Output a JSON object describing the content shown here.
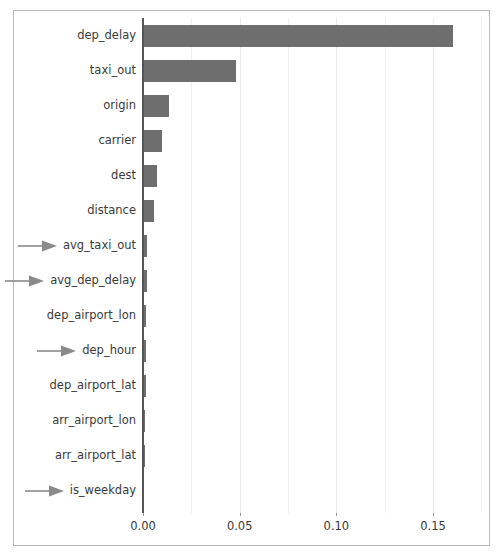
{
  "chart_data": {
    "type": "bar",
    "orientation": "horizontal",
    "title": "",
    "xlabel": "",
    "ylabel": "",
    "xlim": [
      0.0,
      0.1757
    ],
    "xticks": [
      0.0,
      0.05,
      0.1,
      0.15
    ],
    "xtick_labels": [
      "0.00",
      "0.05",
      "0.10",
      "0.15"
    ],
    "grid": true,
    "grid_axis": "x",
    "legend": "none",
    "bar_color": "#6e6e6e",
    "gridline_color": "#ebebeb",
    "axis_color": "#555555",
    "frame_color": "#b9b9b9",
    "annotation_color": "#8a8a8a",
    "annotation_symbol": "right-arrow",
    "categories": [
      "dep_delay",
      "taxi_out",
      "origin",
      "carrier",
      "dest",
      "distance",
      "avg_taxi_out",
      "avg_dep_delay",
      "dep_airport_lon",
      "dep_hour",
      "dep_airport_lat",
      "arr_airport_lon",
      "arr_airport_lat",
      "is_weekday"
    ],
    "values": [
      0.1605,
      0.0481,
      0.0134,
      0.0098,
      0.0072,
      0.0057,
      0.0022,
      0.0021,
      0.0018,
      0.0017,
      0.0014,
      0.0011,
      0.0009,
      0.0004
    ],
    "annotated": [
      false,
      false,
      false,
      false,
      false,
      false,
      true,
      true,
      false,
      true,
      false,
      false,
      false,
      true
    ]
  }
}
